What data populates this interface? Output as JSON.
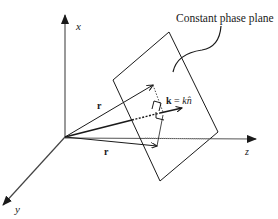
{
  "diagram": {
    "title_label": "Constant phase plane",
    "axes": {
      "x": "x",
      "y": "y",
      "z": "z"
    },
    "vectors": {
      "k_label_bold": "k",
      "k_label_eq": " = ",
      "k_label_k": "k",
      "k_label_n": "n̂",
      "r_upper": "r",
      "r_lower": "r"
    },
    "colors": {
      "line": "#1a1a1a",
      "axis": "#555555",
      "background": "#ffffff"
    }
  }
}
